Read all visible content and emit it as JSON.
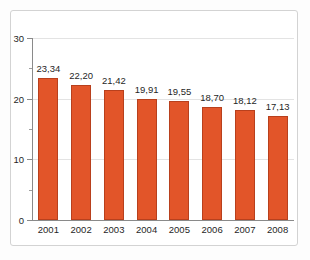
{
  "chart_data": {
    "type": "bar",
    "title": "",
    "subtitle": "",
    "xlabel": "",
    "ylabel": "",
    "categories": [
      "2001",
      "2002",
      "2003",
      "2004",
      "2005",
      "2006",
      "2007",
      "2008"
    ],
    "values": [
      23.34,
      22.2,
      21.42,
      19.91,
      19.55,
      18.7,
      18.12,
      17.13
    ],
    "value_labels": [
      "23,34",
      "22,20",
      "21,42",
      "19,91",
      "19,55",
      "18,70",
      "18,12",
      "17,13"
    ],
    "ylim": [
      0,
      30
    ],
    "y_ticks": [
      0,
      10,
      20,
      30
    ],
    "y_tick_labels": [
      "0",
      "10",
      "20",
      "30"
    ],
    "y_minor_ticks": [
      5,
      15,
      25
    ],
    "grid": true,
    "legend": null,
    "legend_position": "none",
    "bar_color": "#e25529",
    "bar_edge_color": "#b8401d",
    "grid_color": "#e3e3e3",
    "axis_color": "#8a8a8a",
    "text_color": "#1f1f1f",
    "frame_color": "#d3d3d3",
    "background_color": "#ffffff"
  }
}
